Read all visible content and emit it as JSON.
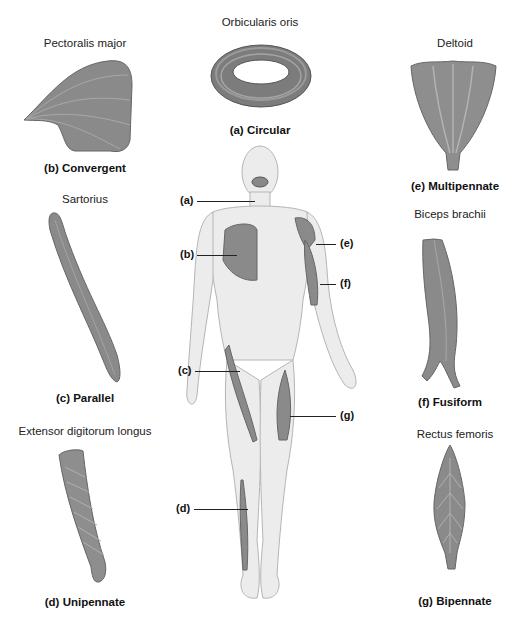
{
  "figure": {
    "center_figure": "Anterior view of human body with muscles highlighted",
    "labels": [
      "(a)",
      "(b)",
      "(c)",
      "(d)",
      "(e)",
      "(f)",
      "(g)"
    ]
  },
  "muscles": [
    {
      "key": "a",
      "name": "Orbicularis oris",
      "caption": "(a) Circular"
    },
    {
      "key": "b",
      "name": "Pectoralis major",
      "caption": "(b) Convergent"
    },
    {
      "key": "c",
      "name": "Sartorius",
      "caption": "(c) Parallel"
    },
    {
      "key": "d",
      "name": "Extensor digitorum longus",
      "caption": "(d) Unipennate"
    },
    {
      "key": "e",
      "name": "Deltoid",
      "caption": "(e) Multipennate"
    },
    {
      "key": "f",
      "name": "Biceps brachii",
      "caption": "(f) Fusiform"
    },
    {
      "key": "g",
      "name": "Rectus femoris",
      "caption": "(g) Bipennate"
    }
  ],
  "colors": {
    "muscle": "#8a8a8a",
    "muscle_dark": "#6b6b6b",
    "skin": "#ececec",
    "skin_outline": "#b5b5b5"
  }
}
